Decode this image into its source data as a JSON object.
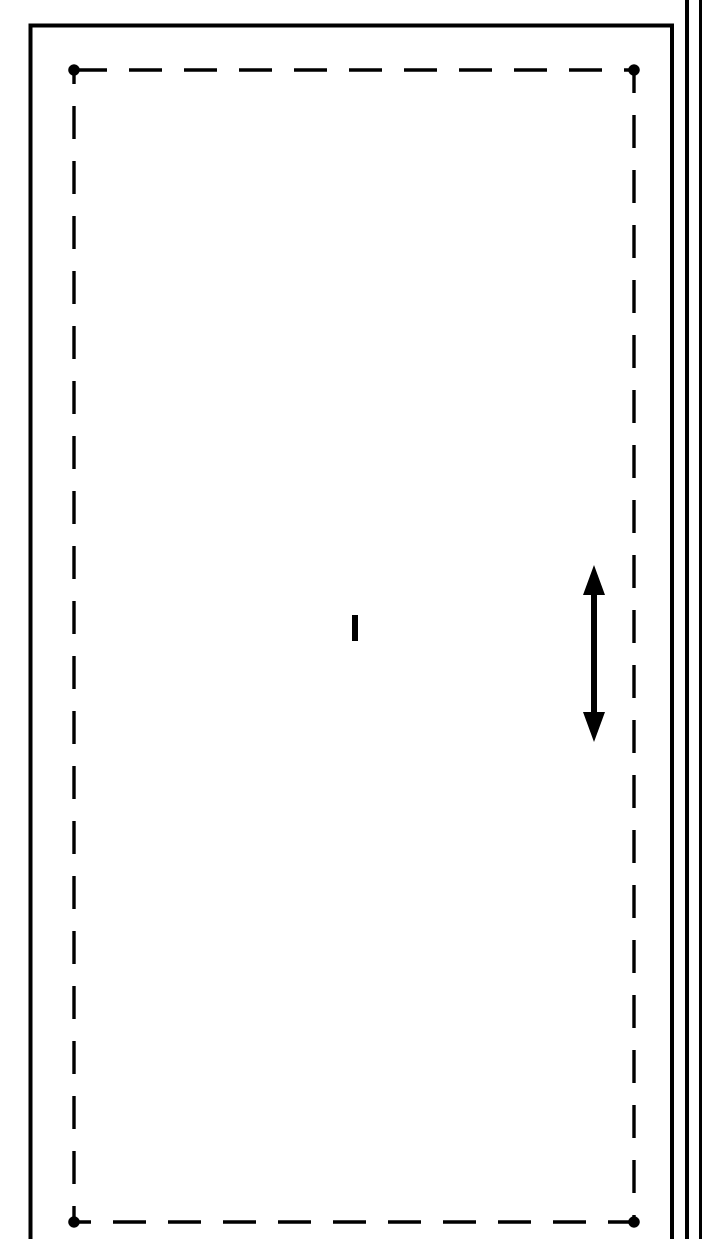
{
  "drawing": {
    "title": "Technical line drawing — dashed boundary rectangle with dimension arrow",
    "canvas": {
      "width": 702,
      "height": 1239,
      "background": "#ffffff"
    },
    "stroke_color": "#000000",
    "outer_frame": {
      "name": "solid-outer-frame",
      "left": 30.5,
      "top": 25.5,
      "right": 672.0,
      "bottom_cut_off": true,
      "bottom": 1245,
      "stroke_width": 4
    },
    "dashed_rect": {
      "name": "dashed-boundary-rectangle",
      "left": 74,
      "top": 70,
      "right": 634,
      "bottom": 1222,
      "stroke_width": 3.4,
      "dash_length": 33,
      "gap_length": 22
    },
    "corner_dots": {
      "name": "corner-node-dots",
      "radius": 5.8,
      "points": [
        {
          "label": "top-left",
          "x": 74,
          "y": 70
        },
        {
          "label": "top-right",
          "x": 634,
          "y": 70
        },
        {
          "label": "bottom-left",
          "x": 74,
          "y": 1222
        },
        {
          "label": "bottom-right",
          "x": 634,
          "y": 1222
        }
      ]
    },
    "center_tick": {
      "name": "center-tick-mark",
      "x": 352,
      "y": 615,
      "width": 6,
      "height": 26
    },
    "dimension_arrow": {
      "name": "vertical-dimension-arrow",
      "x": 594,
      "y_top": 565,
      "y_bottom": 742,
      "shaft_width": 6,
      "head_width": 22,
      "head_length": 30,
      "double_headed": true
    },
    "right_edge_lines": [
      {
        "name": "right-rule-inner",
        "x": 685,
        "width": 4,
        "y_top": 0,
        "y_bottom": 1239
      },
      {
        "name": "right-rule-outer",
        "x": 699,
        "width": 4,
        "y_top": 0,
        "y_bottom": 1239
      }
    ]
  }
}
